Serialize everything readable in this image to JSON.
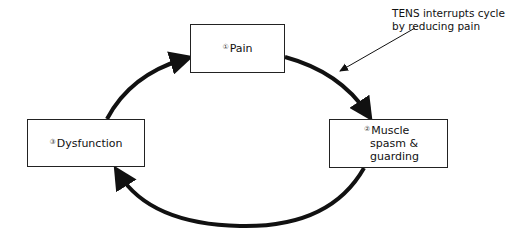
{
  "diagram": {
    "type": "cycle",
    "nodes": [
      {
        "id": 1,
        "number_glyph": "①",
        "label": "Pain"
      },
      {
        "id": 2,
        "number_glyph": "②",
        "label_lines": [
          "Muscle",
          "spasm &",
          "guarding"
        ]
      },
      {
        "id": 3,
        "number_glyph": "③",
        "label": "Dysfunction"
      }
    ],
    "edges": [
      {
        "from": 1,
        "to": 2
      },
      {
        "from": 2,
        "to": 3
      },
      {
        "from": 3,
        "to": 1
      }
    ],
    "annotation": {
      "lines": [
        "TENS interrupts cycle",
        "by reducing pain"
      ],
      "points_to": "edge 1->2"
    },
    "colors": {
      "stroke": "#111111",
      "background": "#ffffff"
    }
  }
}
